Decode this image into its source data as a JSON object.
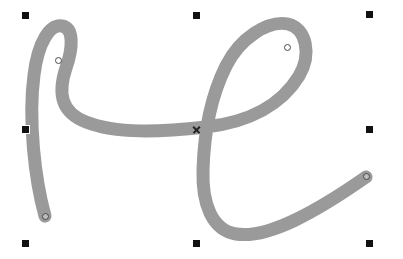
{
  "canvas": {
    "width": 403,
    "height": 259,
    "background_color": "#ffffff",
    "label": "Vector drawing canvas"
  },
  "path_object": {
    "name": "calligraphic-stroke",
    "description": "Thick gray cursive script stroke",
    "stroke_color": "#9a9a9a",
    "stroke_width": 13,
    "fill": "none",
    "selected": true,
    "geometry": "M 45 216 C 35 180 28 120 34 75 C 38 42 50 24 62 26 C 74 28 73 48 66 68 C 58 92 60 112 86 122 C 116 134 160 132 206 127 C 250 122 282 104 299 76 C 312 54 306 28 288 24 C 268 20 240 38 226 66 C 210 98 204 136 203 170 C 202 204 212 230 236 234 C 268 239 316 212 366 177"
  },
  "selection": {
    "label": "Selection bounding box handles",
    "handle_color": "#111111",
    "handle_size": 7,
    "handles": [
      {
        "name": "handle-top-left",
        "x": 25,
        "y": 15,
        "cursor": "nwse-resize"
      },
      {
        "name": "handle-top-center",
        "x": 196,
        "y": 15,
        "cursor": "ns-resize"
      },
      {
        "name": "handle-top-right",
        "x": 369,
        "y": 14,
        "cursor": "nesw-resize"
      },
      {
        "name": "handle-middle-left",
        "x": 25,
        "y": 129,
        "cursor": "ew-resize"
      },
      {
        "name": "handle-middle-right",
        "x": 369,
        "y": 129,
        "cursor": "ew-resize"
      },
      {
        "name": "handle-bottom-left",
        "x": 25,
        "y": 243,
        "cursor": "nesw-resize"
      },
      {
        "name": "handle-bottom-center",
        "x": 196,
        "y": 243,
        "cursor": "ns-resize"
      },
      {
        "name": "handle-bottom-right",
        "x": 369,
        "y": 243,
        "cursor": "nwse-resize"
      }
    ]
  },
  "nodes": {
    "label": "Path node markers",
    "marker_color": "#4a4a4a",
    "points": [
      {
        "name": "node-start-bottom-left",
        "x": 45,
        "y": 216,
        "type": "endpoint"
      },
      {
        "name": "node-upper-left-curve",
        "x": 58,
        "y": 60,
        "type": "smooth"
      },
      {
        "name": "node-upper-right-loop",
        "x": 287,
        "y": 47,
        "type": "smooth"
      },
      {
        "name": "node-end-right",
        "x": 366,
        "y": 176,
        "type": "endpoint"
      }
    ],
    "crossings": [
      {
        "name": "node-crossing-center",
        "x": 196,
        "y": 129,
        "type": "intersection"
      }
    ]
  }
}
